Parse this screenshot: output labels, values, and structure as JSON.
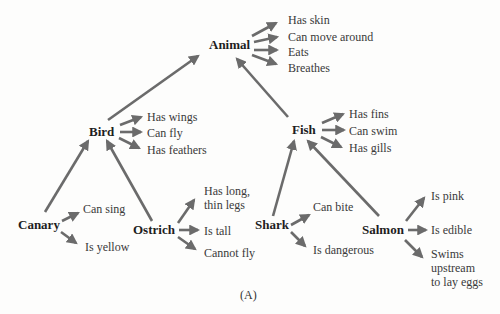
{
  "figure": {
    "caption": "(A)",
    "arrow_color": "#6b6b6b"
  },
  "nodes": {
    "animal": "Animal",
    "bird": "Bird",
    "fish": "Fish",
    "canary": "Canary",
    "ostrich": "Ostrich",
    "shark": "Shark",
    "salmon": "Salmon"
  },
  "properties": {
    "animal": [
      "Has skin",
      "Can move around",
      "Eats",
      "Breathes"
    ],
    "bird": [
      "Has wings",
      "Can fly",
      "Has feathers"
    ],
    "fish": [
      "Has fins",
      "Can swim",
      "Has gills"
    ],
    "canary": [
      "Can sing",
      "Is yellow"
    ],
    "ostrich": [
      "Has long,",
      "thin legs",
      "Is tall",
      "Cannot fly"
    ],
    "shark": [
      "Can bite",
      "Is dangerous"
    ],
    "salmon": [
      "Is pink",
      "Is edible",
      "Swims",
      "upstream",
      "to lay eggs"
    ]
  },
  "edges": [
    {
      "from": "bird",
      "to": "animal",
      "relation": "is-a"
    },
    {
      "from": "fish",
      "to": "animal",
      "relation": "is-a"
    },
    {
      "from": "canary",
      "to": "bird",
      "relation": "is-a"
    },
    {
      "from": "ostrich",
      "to": "bird",
      "relation": "is-a"
    },
    {
      "from": "shark",
      "to": "fish",
      "relation": "is-a"
    },
    {
      "from": "salmon",
      "to": "fish",
      "relation": "is-a"
    }
  ]
}
